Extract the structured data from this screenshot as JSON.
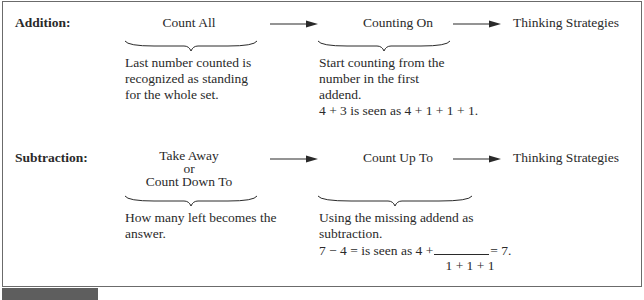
{
  "addition": {
    "label": "Addition:",
    "stage1": "Count All",
    "stage2": "Counting On",
    "stage3": "Thinking Strategies",
    "desc1": [
      "Last number counted is",
      "recognized as standing",
      "for the whole set."
    ],
    "desc2": [
      "Start counting from the",
      "number in the first",
      "addend.",
      "4 + 3 is seen as 4 + 1 + 1 + 1."
    ]
  },
  "subtraction": {
    "label": "Subtraction:",
    "stage1_lines": [
      "Take Away",
      "or",
      "Count Down To"
    ],
    "stage2": "Count Up To",
    "stage3": "Thinking Strategies",
    "desc1": [
      "How many left becomes the",
      "answer."
    ],
    "desc2": [
      "Using the missing addend as",
      "subtraction."
    ],
    "equation_left": "7 − 4 = is seen as 4 +",
    "equation_right": "= 7.",
    "equation_under": "1 + 1 + 1"
  }
}
